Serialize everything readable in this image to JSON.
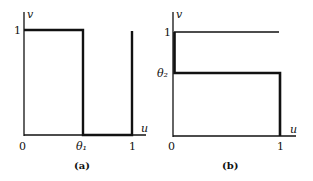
{
  "figure": {
    "panels": [
      {
        "id": "a",
        "caption": "(a)",
        "axes": {
          "x_label": "u",
          "y_label": "v",
          "x_ticks": [
            "0",
            "θ₁",
            "1"
          ],
          "y_ticks": [
            "1"
          ]
        },
        "description": "Thick path: horizontal at v=1 from u=0 to θ₁, drops to v=0 at u=θ₁, runs along v=0 to u=1, rises to v=1 at u=1"
      },
      {
        "id": "b",
        "caption": "(b)",
        "axes": {
          "x_label": "u",
          "y_label": "v",
          "x_ticks": [
            "0",
            "1"
          ],
          "y_ticks": [
            "1",
            "θ₂"
          ]
        },
        "description": "Thin line at v=1 from u=0 to 1; thick path: down v-axis from 1 to θ₂, horizontal at v=θ₂ to u=1, then down to v=0"
      }
    ],
    "colors": {
      "line": "#111111",
      "background": "#ffffff"
    }
  }
}
